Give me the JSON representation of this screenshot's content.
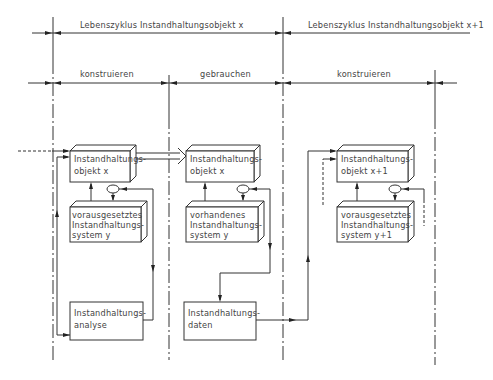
{
  "lifecycles": [
    {
      "label": "Lebenszyklus  Instandhaltungsobjekt  x"
    },
    {
      "label": "Lebenszyklus  Instandhaltungsobjekt  x+1"
    }
  ],
  "phases": [
    {
      "label": "konstruieren"
    },
    {
      "label": "gebrauchen"
    },
    {
      "label": "konstruieren"
    }
  ],
  "boxes": {
    "object_x_construct": {
      "line1": "Instandhaltungs-",
      "line2": "objekt  x"
    },
    "system_y_required": {
      "line1": "vorausgesetztes",
      "line2": "Instandhaltungs-",
      "line3": "system   y"
    },
    "analysis": {
      "line1": "Instandhaltungs-",
      "line2": "analyse"
    },
    "object_x_use": {
      "line1": "Instandhaltungs-",
      "line2": "objekt  x"
    },
    "system_y_existing": {
      "line1": "vorhandenes",
      "line2": "Instandhaltungs-",
      "line3": "system   y"
    },
    "data": {
      "line1": "Instandhaltungs-",
      "line2": "daten"
    },
    "object_x1": {
      "line1": "Instandhaltungs-",
      "line2": "objekt  x+1"
    },
    "system_y1_required": {
      "line1": "vorausgesetztes",
      "line2": "Instandhaltungs-",
      "line3": "system   y+1"
    }
  }
}
